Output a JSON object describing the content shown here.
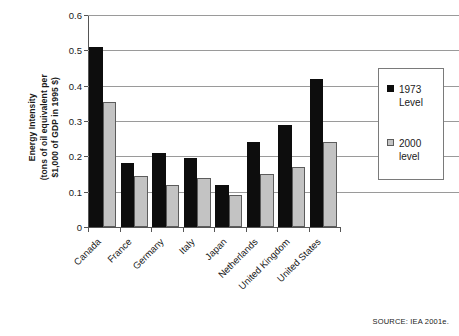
{
  "chart_data": {
    "type": "bar",
    "title": "",
    "xlabel": "",
    "ylabel": "Energy Intensity (tons of oil equivalent per $1,000 of GDP in 1995 $)",
    "ylabel_lines": [
      "Energy Intensity",
      "(tons of oil equivalent per",
      "$1,000 of GDP in 1995 $)"
    ],
    "categories": [
      "Canada",
      "France",
      "Germany",
      "Italy",
      "Japan",
      "Netherlands",
      "United Kingdom",
      "United States"
    ],
    "series": [
      {
        "name": "1973 Level",
        "color": "#0d0d0d",
        "values": [
          0.51,
          0.18,
          0.21,
          0.195,
          0.12,
          0.24,
          0.29,
          0.42
        ]
      },
      {
        "name": "2000 level",
        "color": "#c3c3c3",
        "values": [
          0.355,
          0.145,
          0.12,
          0.14,
          0.09,
          0.15,
          0.17,
          0.24
        ]
      }
    ],
    "ylim": [
      0,
      0.6
    ],
    "yticks": [
      0,
      0.1,
      0.2,
      0.3,
      0.4,
      0.5,
      0.6
    ],
    "ytick_labels": [
      "0",
      "0.1",
      "0.2",
      "0.3",
      "0.4",
      "0.5",
      "0.6"
    ],
    "grid": true,
    "legend_position": "right"
  },
  "legend": {
    "entries": [
      {
        "label_line1": "1973",
        "label_line2": "Level"
      },
      {
        "label_line1": "2000",
        "label_line2": "level"
      }
    ]
  },
  "source": {
    "text": "SOURCE: IEA 2001e."
  }
}
